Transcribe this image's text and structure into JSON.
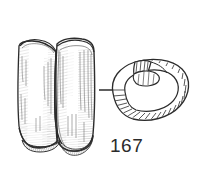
{
  "figure": {
    "catalogue_number": "167",
    "background_color": "#ffffff",
    "ink_color": "#2b2b2b",
    "hatch_color": "#555555",
    "plate_width": 198,
    "plate_height": 176,
    "objects": [
      {
        "id": "left-object",
        "name": "folded-sheet-side-view",
        "view": "side elevation",
        "description": "Folded / bent rectangular sheet object shown in side view with two adjoining panels and shaded hatching along the fold and lower edges"
      },
      {
        "id": "right-object",
        "name": "coiled-strip-plan-view",
        "view": "plan view",
        "description": "Coiled strip or spiral ring drawn in plan, with transverse hatch bands across the band and an overlapping terminal"
      }
    ],
    "connector": {
      "name": "leader-dash",
      "description": "Short horizontal dash linking the two views of the same object"
    }
  }
}
